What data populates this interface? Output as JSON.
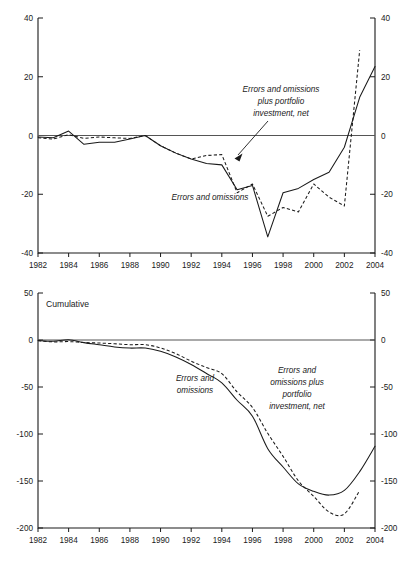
{
  "figure": {
    "panels": [
      {
        "id": "annual",
        "title": "",
        "series_labels": {
          "solid": "Errors and omissions",
          "dashed_line1": "Errors and omissions",
          "dashed_line2": "plus portfolio",
          "dashed_line3": "investment, net"
        }
      },
      {
        "id": "cumulative",
        "title": "Cumulative",
        "series_labels": {
          "solid_line1": "Errors and",
          "solid_line2": "omissions",
          "dashed_line1": "Errors and",
          "dashed_line2": "omissions plus",
          "dashed_line3": "portfolio",
          "dashed_line4": "investment, net"
        }
      }
    ]
  },
  "chart_data": [
    {
      "type": "line",
      "title": "",
      "xlabel": "",
      "ylabel": "",
      "xlim": [
        1982,
        2004
      ],
      "ylim": [
        -40,
        40
      ],
      "yticks": [
        -40,
        -20,
        0,
        20,
        40
      ],
      "ytick_labels": [
        "-40",
        "-20",
        "0",
        "20",
        "40"
      ],
      "xticks": [
        1982,
        1984,
        1986,
        1988,
        1990,
        1992,
        1994,
        1996,
        1998,
        2000,
        2002,
        2004
      ],
      "xtick_labels": [
        "1982",
        "1984",
        "1986",
        "1988",
        "1990",
        "1992",
        "1994",
        "1996",
        "1998",
        "2000",
        "2002",
        "2004"
      ],
      "grid": false,
      "legend": "annotations",
      "x": [
        1982,
        1983,
        1984,
        1985,
        1986,
        1987,
        1988,
        1989,
        1990,
        1991,
        1992,
        1993,
        1994,
        1995,
        1996,
        1997,
        1998,
        1999,
        2000,
        2001,
        2002,
        2003,
        2004
      ],
      "series": [
        {
          "name": "Errors and omissions",
          "style": "solid",
          "values": [
            -0.5,
            -0.8,
            1.5,
            -3.0,
            -2.3,
            -2.3,
            -1.2,
            0.0,
            -3.5,
            -6.0,
            -8.0,
            -9.5,
            -10.0,
            -18.5,
            -17.0,
            -34.5,
            -19.5,
            -18.0,
            -15.0,
            -12.5,
            -4.0,
            13.0,
            23.5
          ]
        },
        {
          "name": "Errors and omissions plus portfolio investment, net",
          "style": "dashed",
          "values": [
            -0.8,
            -1.2,
            0.3,
            -1.0,
            -0.5,
            -0.8,
            -1.0,
            0.0,
            -3.5,
            -6.0,
            -8.0,
            -6.8,
            -6.5,
            -19.5,
            -16.5,
            -27.5,
            -24.5,
            -26.0,
            -16.5,
            -21.0,
            -24.0,
            29.0,
            null
          ]
        }
      ],
      "annotations": [
        {
          "text": "Errors and omissions plus portfolio investment, net",
          "target_x": 1994.5,
          "target_y": -6.5,
          "style": "italic"
        },
        {
          "text": "Errors and omissions",
          "style": "italic"
        }
      ]
    },
    {
      "type": "line",
      "title": "Cumulative",
      "xlabel": "",
      "ylabel": "",
      "xlim": [
        1982,
        2004
      ],
      "ylim": [
        -200,
        50
      ],
      "yticks": [
        -200,
        -150,
        -100,
        -50,
        0,
        50
      ],
      "ytick_labels": [
        "-200",
        "-150",
        "-100",
        "-50",
        "0",
        "50"
      ],
      "xticks": [
        1982,
        1984,
        1986,
        1988,
        1990,
        1992,
        1994,
        1996,
        1998,
        2000,
        2002,
        2004
      ],
      "xtick_labels": [
        "1982",
        "1984",
        "1986",
        "1988",
        "1990",
        "1992",
        "1994",
        "1996",
        "1998",
        "2000",
        "2002",
        "2004"
      ],
      "grid": false,
      "legend": "annotations",
      "x": [
        1982,
        1983,
        1984,
        1985,
        1986,
        1987,
        1988,
        1989,
        1990,
        1991,
        1992,
        1993,
        1994,
        1995,
        1996,
        1997,
        1998,
        1999,
        2000,
        2001,
        2002,
        2003,
        2004
      ],
      "series": [
        {
          "name": "Errors and omissions",
          "style": "solid",
          "values": [
            -0.5,
            -1.3,
            0.2,
            -2.8,
            -5.1,
            -7.4,
            -8.6,
            -8.6,
            -12.1,
            -18.1,
            -26.1,
            -35.6,
            -45.6,
            -64.1,
            -81.1,
            -115.6,
            -135.1,
            -153.1,
            -161.0,
            -165.0,
            -160.0,
            -140.0,
            -113.0
          ]
        },
        {
          "name": "Errors and omissions plus portfolio investment, net",
          "style": "dashed",
          "values": [
            -0.8,
            -2.0,
            -1.7,
            -2.7,
            -3.2,
            -4.0,
            -5.0,
            -5.0,
            -8.5,
            -14.5,
            -22.5,
            -29.3,
            -35.8,
            -55.3,
            -71.8,
            -99.3,
            -123.8,
            -149.8,
            -166.3,
            -183.0,
            -185.0,
            -160.0,
            null
          ]
        }
      ],
      "annotations": [
        {
          "text": "Errors and omissions",
          "style": "italic"
        },
        {
          "text": "Errors and omissions plus portfolio investment, net",
          "style": "italic"
        }
      ]
    }
  ]
}
